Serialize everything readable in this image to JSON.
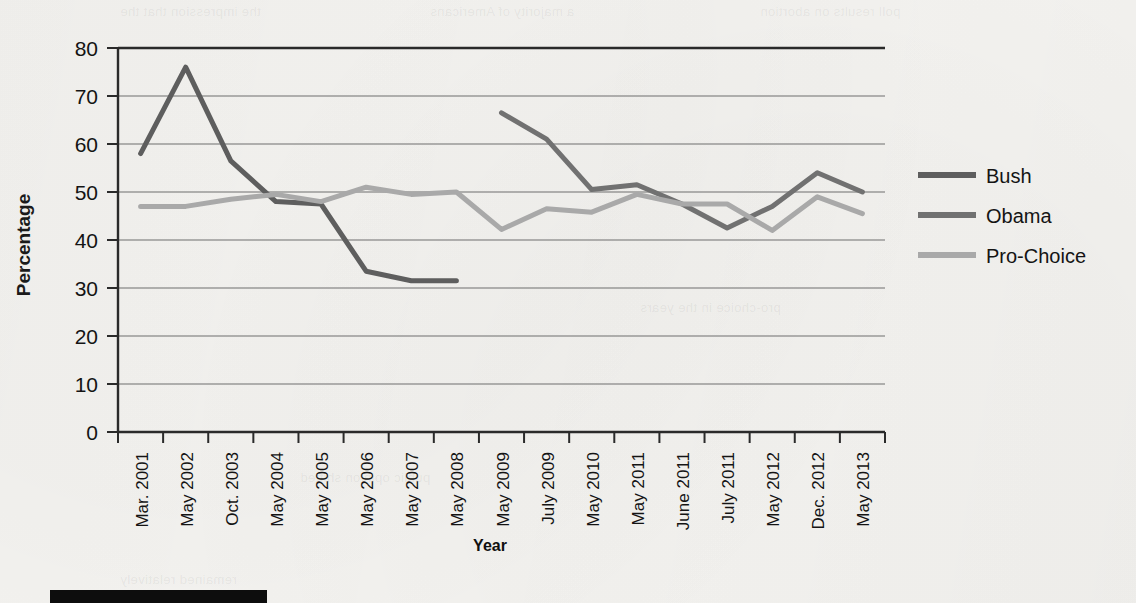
{
  "page": {
    "background_color": "#f6f5f2",
    "redaction_bar": {
      "label": "redacted-caption-bar",
      "color": "#0d0d0d"
    }
  },
  "chart_data": {
    "type": "line",
    "title": "",
    "xlabel": "Year",
    "ylabel": "Percentage",
    "ylim": [
      0,
      80
    ],
    "ytick_step": 10,
    "yticks": [
      "0",
      "10",
      "20",
      "30",
      "40",
      "50",
      "60",
      "70",
      "80"
    ],
    "grid": true,
    "grid_axis": "y",
    "legend_position": "right",
    "categories": [
      "Mar. 2001",
      "May 2002",
      "Oct. 2003",
      "May 2004",
      "May 2005",
      "May 2006",
      "May 2007",
      "May 2008",
      "May 2009",
      "July 2009",
      "May 2010",
      "May 2011",
      "June 2011",
      "July 2011",
      "May 2012",
      "Dec. 2012",
      "May 2013"
    ],
    "series": [
      {
        "name": "Bush",
        "color": "#5e5e5e",
        "values": [
          58,
          76,
          56.5,
          48,
          47.5,
          33.5,
          31.5,
          31.5,
          null,
          null,
          null,
          null,
          null,
          null,
          null,
          null,
          null
        ]
      },
      {
        "name": "Obama",
        "color": "#717171",
        "values": [
          null,
          null,
          null,
          null,
          null,
          null,
          null,
          null,
          66.5,
          61,
          50.5,
          51.5,
          47.5,
          42.5,
          47,
          54,
          50
        ]
      },
      {
        "name": "Pro-Choice",
        "color": "#a9a9a9",
        "values": [
          47,
          47,
          48.5,
          49.5,
          48,
          51,
          49.5,
          50,
          42.2,
          46.5,
          45.8,
          49.5,
          47.5,
          47.5,
          42,
          49,
          45.5
        ]
      }
    ]
  },
  "legend": {
    "items": [
      {
        "label": "Bush",
        "color": "#5e5e5e"
      },
      {
        "label": "Obama",
        "color": "#717171"
      },
      {
        "label": "Pro-Choice",
        "color": "#a9a9a9"
      }
    ]
  },
  "ghost_text": [
    "the impression that the",
    "a majority of Americans",
    "poll results on abortion",
    "public opinion shifted",
    "pro-choice in the years",
    "remained relatively"
  ]
}
